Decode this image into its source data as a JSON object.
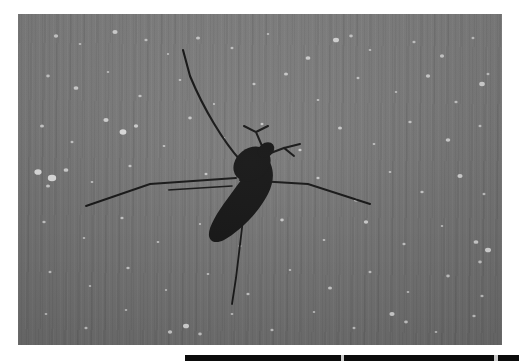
{
  "canvas": {
    "width": 519,
    "height": 363,
    "background_color": "#ffffff"
  },
  "photo": {
    "alt_text": "Dark silhouette of a long-legged insect on a textured gray surface",
    "subject": "stonefly-insect-silhouette",
    "background_color": "#7a7a7a",
    "speckle_color": "#e8e8e8",
    "silhouette_color": "#101010",
    "frame": {
      "left": 18,
      "top": 14,
      "width": 484,
      "height": 331
    }
  },
  "bottom_bar": {
    "color": "#0b0b0b",
    "gap_color": "#c9c9c9",
    "left": 185,
    "top": 355,
    "width": 334,
    "height": 6,
    "segments": [
      {
        "x": 0,
        "w": 156
      },
      {
        "x": 159,
        "w": 150
      },
      {
        "x": 313,
        "w": 21
      }
    ],
    "gaps": [
      {
        "x": 156,
        "w": 3
      },
      {
        "x": 309,
        "w": 4
      }
    ]
  },
  "speckles": [
    {
      "x": 38,
      "y": 22,
      "r": 2.2
    },
    {
      "x": 62,
      "y": 30,
      "r": 1.4
    },
    {
      "x": 97,
      "y": 18,
      "r": 2.6
    },
    {
      "x": 128,
      "y": 26,
      "r": 1.6
    },
    {
      "x": 150,
      "y": 40,
      "r": 1.2
    },
    {
      "x": 180,
      "y": 24,
      "r": 2.0
    },
    {
      "x": 214,
      "y": 34,
      "r": 1.5
    },
    {
      "x": 250,
      "y": 20,
      "r": 1.3
    },
    {
      "x": 290,
      "y": 44,
      "r": 2.4
    },
    {
      "x": 318,
      "y": 26,
      "r": 3.0
    },
    {
      "x": 333,
      "y": 22,
      "r": 1.8
    },
    {
      "x": 352,
      "y": 36,
      "r": 1.4
    },
    {
      "x": 396,
      "y": 28,
      "r": 1.6
    },
    {
      "x": 424,
      "y": 42,
      "r": 2.1
    },
    {
      "x": 455,
      "y": 24,
      "r": 1.5
    },
    {
      "x": 30,
      "y": 62,
      "r": 1.8
    },
    {
      "x": 58,
      "y": 74,
      "r": 2.4
    },
    {
      "x": 90,
      "y": 58,
      "r": 1.3
    },
    {
      "x": 122,
      "y": 82,
      "r": 1.7
    },
    {
      "x": 162,
      "y": 66,
      "r": 1.4
    },
    {
      "x": 196,
      "y": 90,
      "r": 1.2
    },
    {
      "x": 236,
      "y": 70,
      "r": 1.6
    },
    {
      "x": 268,
      "y": 60,
      "r": 2.0
    },
    {
      "x": 300,
      "y": 86,
      "r": 1.4
    },
    {
      "x": 340,
      "y": 64,
      "r": 1.5
    },
    {
      "x": 378,
      "y": 78,
      "r": 1.3
    },
    {
      "x": 410,
      "y": 62,
      "r": 2.2
    },
    {
      "x": 438,
      "y": 88,
      "r": 1.6
    },
    {
      "x": 464,
      "y": 70,
      "r": 2.8
    },
    {
      "x": 470,
      "y": 60,
      "r": 1.5
    },
    {
      "x": 24,
      "y": 112,
      "r": 2.0
    },
    {
      "x": 54,
      "y": 128,
      "r": 1.5
    },
    {
      "x": 88,
      "y": 106,
      "r": 2.6
    },
    {
      "x": 105,
      "y": 118,
      "r": 3.4
    },
    {
      "x": 118,
      "y": 112,
      "r": 2.2
    },
    {
      "x": 146,
      "y": 132,
      "r": 1.4
    },
    {
      "x": 172,
      "y": 104,
      "r": 1.8
    },
    {
      "x": 206,
      "y": 124,
      "r": 1.3
    },
    {
      "x": 244,
      "y": 110,
      "r": 1.5
    },
    {
      "x": 282,
      "y": 136,
      "r": 1.6
    },
    {
      "x": 322,
      "y": 114,
      "r": 2.0
    },
    {
      "x": 356,
      "y": 130,
      "r": 1.4
    },
    {
      "x": 392,
      "y": 108,
      "r": 1.7
    },
    {
      "x": 430,
      "y": 126,
      "r": 2.3
    },
    {
      "x": 462,
      "y": 112,
      "r": 1.5
    },
    {
      "x": 20,
      "y": 158,
      "r": 3.6
    },
    {
      "x": 34,
      "y": 164,
      "r": 4.2
    },
    {
      "x": 48,
      "y": 156,
      "r": 2.4
    },
    {
      "x": 30,
      "y": 172,
      "r": 2.0
    },
    {
      "x": 74,
      "y": 168,
      "r": 1.4
    },
    {
      "x": 112,
      "y": 152,
      "r": 1.6
    },
    {
      "x": 150,
      "y": 176,
      "r": 1.3
    },
    {
      "x": 188,
      "y": 160,
      "r": 1.5
    },
    {
      "x": 226,
      "y": 180,
      "r": 1.2
    },
    {
      "x": 300,
      "y": 164,
      "r": 1.6
    },
    {
      "x": 338,
      "y": 186,
      "r": 2.0
    },
    {
      "x": 372,
      "y": 158,
      "r": 1.4
    },
    {
      "x": 404,
      "y": 178,
      "r": 1.7
    },
    {
      "x": 442,
      "y": 162,
      "r": 2.6
    },
    {
      "x": 466,
      "y": 180,
      "r": 1.5
    },
    {
      "x": 26,
      "y": 208,
      "r": 1.7
    },
    {
      "x": 66,
      "y": 224,
      "r": 1.3
    },
    {
      "x": 104,
      "y": 204,
      "r": 1.6
    },
    {
      "x": 140,
      "y": 228,
      "r": 1.4
    },
    {
      "x": 182,
      "y": 210,
      "r": 1.2
    },
    {
      "x": 222,
      "y": 232,
      "r": 1.5
    },
    {
      "x": 264,
      "y": 206,
      "r": 1.8
    },
    {
      "x": 306,
      "y": 226,
      "r": 1.4
    },
    {
      "x": 348,
      "y": 208,
      "r": 2.2
    },
    {
      "x": 386,
      "y": 230,
      "r": 1.6
    },
    {
      "x": 424,
      "y": 212,
      "r": 1.3
    },
    {
      "x": 458,
      "y": 228,
      "r": 2.4
    },
    {
      "x": 470,
      "y": 236,
      "r": 3.0
    },
    {
      "x": 462,
      "y": 248,
      "r": 1.8
    },
    {
      "x": 32,
      "y": 258,
      "r": 1.5
    },
    {
      "x": 72,
      "y": 272,
      "r": 1.3
    },
    {
      "x": 110,
      "y": 254,
      "r": 1.7
    },
    {
      "x": 148,
      "y": 276,
      "r": 1.2
    },
    {
      "x": 190,
      "y": 260,
      "r": 1.4
    },
    {
      "x": 230,
      "y": 280,
      "r": 1.6
    },
    {
      "x": 272,
      "y": 256,
      "r": 1.3
    },
    {
      "x": 312,
      "y": 274,
      "r": 2.0
    },
    {
      "x": 352,
      "y": 258,
      "r": 1.5
    },
    {
      "x": 390,
      "y": 278,
      "r": 1.4
    },
    {
      "x": 430,
      "y": 262,
      "r": 1.8
    },
    {
      "x": 464,
      "y": 282,
      "r": 1.6
    },
    {
      "x": 28,
      "y": 300,
      "r": 1.4
    },
    {
      "x": 68,
      "y": 314,
      "r": 1.6
    },
    {
      "x": 108,
      "y": 296,
      "r": 1.3
    },
    {
      "x": 152,
      "y": 318,
      "r": 2.2
    },
    {
      "x": 168,
      "y": 312,
      "r": 3.0
    },
    {
      "x": 182,
      "y": 320,
      "r": 1.8
    },
    {
      "x": 214,
      "y": 300,
      "r": 1.4
    },
    {
      "x": 254,
      "y": 316,
      "r": 1.6
    },
    {
      "x": 296,
      "y": 298,
      "r": 1.3
    },
    {
      "x": 336,
      "y": 314,
      "r": 1.5
    },
    {
      "x": 374,
      "y": 300,
      "r": 2.6
    },
    {
      "x": 388,
      "y": 308,
      "r": 1.9
    },
    {
      "x": 418,
      "y": 318,
      "r": 1.4
    },
    {
      "x": 456,
      "y": 302,
      "r": 1.7
    }
  ]
}
